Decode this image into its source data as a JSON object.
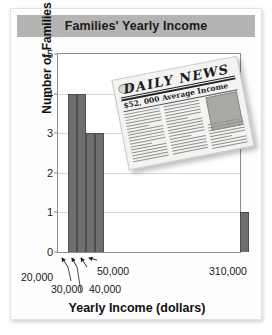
{
  "figure": {
    "title": "Families' Yearly Income"
  },
  "chart_data": {
    "type": "bar",
    "title": "Families' Yearly Income",
    "xlabel": "Yearly Income (dollars)",
    "ylabel": "Number of Families",
    "ylim": [
      0,
      5
    ],
    "yticks": [
      0,
      1,
      2,
      3,
      4,
      5
    ],
    "grid": true,
    "legend": null,
    "categories": [
      "20,000",
      "30,000",
      "40,000",
      "50,000",
      "310,000"
    ],
    "values": [
      4,
      4,
      3,
      3,
      1
    ],
    "bars": [
      {
        "label": "20,000",
        "value": 4
      },
      {
        "label": "30,000",
        "value": 4
      },
      {
        "label": "40,000",
        "value": 3
      },
      {
        "label": "50,000",
        "value": 3
      },
      {
        "label": "310,000",
        "value": 1
      }
    ],
    "xtick_labels": [
      "20,000",
      "30,000",
      "40,000",
      "50,000",
      "310,000"
    ],
    "annotations": [
      {
        "text": "$52,000 Average Income",
        "kind": "newspaper-headline"
      }
    ]
  },
  "newspaper": {
    "masthead": "DAILY NEWS",
    "headline": "$52, 000 Average Income"
  },
  "colors": {
    "bar": "#6e6e6e",
    "bar_edge": "#4d4d4d",
    "title_band": "#b4b4b4",
    "grid": "#d8d8d8",
    "axis": "#8c8c8c"
  }
}
